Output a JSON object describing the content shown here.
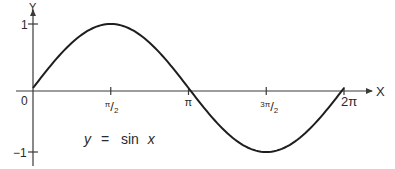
{
  "chart_data": {
    "type": "line",
    "title": "",
    "annotation": {
      "y_part": "y",
      "equals": "=",
      "func": "sin",
      "x_part": "x"
    },
    "xlabel": "X",
    "ylabel": "Y",
    "xlim": [
      0,
      6.2832
    ],
    "ylim": [
      -1,
      1
    ],
    "grid": false,
    "legend": "none",
    "origin_label": "0",
    "x_ticks": [
      {
        "value": 1.5708,
        "label_num": "π",
        "label_den": "2",
        "label_text": "π/2"
      },
      {
        "value": 3.1416,
        "label_text": "π"
      },
      {
        "value": 4.7124,
        "label_num": "3π",
        "label_den": "2",
        "label_text": "3π/2"
      },
      {
        "value": 6.2832,
        "label_text": "2π"
      }
    ],
    "y_ticks": [
      {
        "value": 1,
        "label_text": "1"
      },
      {
        "value": -1,
        "label_text": "−1"
      }
    ],
    "series": [
      {
        "name": "y = sin x",
        "function": "sin",
        "x": [
          0,
          0.7854,
          1.5708,
          2.3562,
          3.1416,
          3.927,
          4.7124,
          5.4978,
          6.2832
        ],
        "y": [
          0,
          0.7071,
          1,
          0.7071,
          0,
          -0.7071,
          -1,
          -0.7071,
          0
        ]
      }
    ]
  }
}
